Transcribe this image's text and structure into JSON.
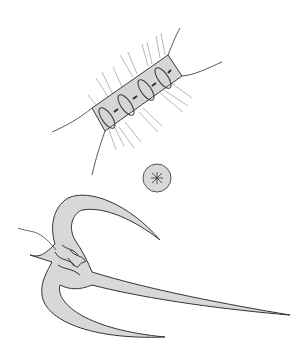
{
  "image": {
    "width": 308,
    "height": 364,
    "background": "#ffffff",
    "subjects": [
      {
        "name": "chain-diatom",
        "description": "Four-celled chain diatom with setae"
      },
      {
        "name": "round-cell",
        "description": "Small circular cell with central star mark"
      },
      {
        "name": "three-horned-dinoflagellate",
        "description": "Ceratium-like organism with three long horns"
      }
    ],
    "colors": {
      "fill": "#d8d8d8",
      "stroke": "#3a3a3a",
      "hair": "#8a8a8a"
    }
  }
}
